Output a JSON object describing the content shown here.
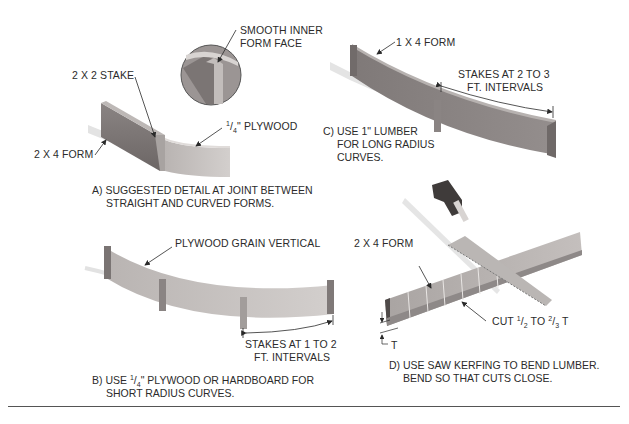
{
  "figure": {
    "panels": [
      {
        "id": "A",
        "caption_line1": "A) SUGGESTED DETAIL AT JOINT BETWEEN",
        "caption_line2": "STRAIGHT AND CURVED FORMS.",
        "labels": {
          "smooth_face_1": "SMOOTH INNER",
          "smooth_face_2": "FORM FACE",
          "stake": "2 X 2 STAKE",
          "plywood_num": "1",
          "plywood_den": "4",
          "plywood_rest": "\" PLYWOOD",
          "form": "2 X 4 FORM"
        }
      },
      {
        "id": "B",
        "caption_pre": "B) USE ",
        "caption_num": "1",
        "caption_den": "4",
        "caption_post": "\" PLYWOOD OR HARDBOARD FOR",
        "caption_line2": "SHORT RADIUS CURVES.",
        "labels": {
          "grain": "PLYWOOD GRAIN VERTICAL",
          "stakes_1": "STAKES AT 1 TO 2",
          "stakes_2": "FT. INTERVALS"
        }
      },
      {
        "id": "C",
        "caption_line1": "C) USE 1\" LUMBER",
        "caption_line2": "FOR LONG RADIUS",
        "caption_line3": "CURVES.",
        "labels": {
          "form": "1 X 4 FORM",
          "stakes_1": "STAKES AT 2 TO 3",
          "stakes_2": "FT. INTERVALS"
        }
      },
      {
        "id": "D",
        "caption_line1": "D) USE SAW KERFING TO BEND LUMBER.",
        "caption_line2": "BEND SO THAT CUTS CLOSE.",
        "labels": {
          "form": "2 X 4 FORM",
          "cut_pre": "CUT ",
          "cut_n1": "1",
          "cut_d1": "2",
          "cut_mid": " TO ",
          "cut_n2": "2",
          "cut_d2": "3",
          "cut_post": " T",
          "thickness": "T"
        }
      }
    ],
    "colors": {
      "wood_dark": "#6e6868",
      "wood_mid": "#8f8a89",
      "wood_light": "#bdb8b6",
      "plywood": "#c9c5c3",
      "shadow": "#e2e2e2",
      "line": "#2a2a2a"
    }
  }
}
